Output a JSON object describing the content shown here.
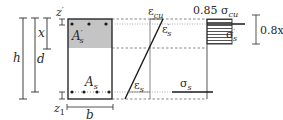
{
  "diagram": {
    "colors": {
      "line": "#2a2a2a",
      "compression_zone": "#c4c4c4",
      "dashed": "#555555",
      "background": "#ffffff"
    },
    "section": {
      "width_label": "b",
      "height_label": "h",
      "effective_depth_label": "d",
      "neutral_axis_depth_label": "x",
      "top_cover_label": "z′",
      "top_cover_base": "z",
      "top_cover_prime": "′",
      "bottom_cover_label": "z1",
      "bottom_cover_base": "z",
      "bottom_cover_sub": "1",
      "top_steel_label": "A′s",
      "top_steel_base": "A",
      "top_steel_prime": "′",
      "top_steel_sub": "s",
      "bottom_steel_label": "As",
      "bottom_steel_base": "A",
      "bottom_steel_sub": "s",
      "top_bars_count": 3,
      "bottom_bars_count": 4
    },
    "strain_diagram": {
      "ultimate_concrete_strain_label": "εcu",
      "ecu_base": "ε",
      "ecu_sub": "cu",
      "top_steel_strain_label": "ε′s",
      "ets_base": "ε",
      "ets_prime": "′",
      "ets_sub": "s",
      "bottom_steel_strain_label": "εs",
      "es_base": "ε",
      "es_sub": "s"
    },
    "stress_diagram": {
      "concrete_stress_label": "0.85 σcu",
      "concrete_stress_coef": "0.85 σ",
      "concrete_stress_sub": "cu",
      "top_steel_stress_label": "σ′s",
      "tss_base": "σ",
      "tss_prime": "′",
      "tss_sub": "s",
      "bottom_steel_stress_label": "σs",
      "bss_base": "σ",
      "bss_sub": "s",
      "block_depth_label": "0.8x"
    }
  }
}
